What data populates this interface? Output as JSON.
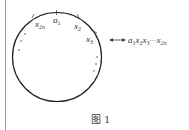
{
  "figure": {
    "caption": "图 1",
    "labels": {
      "a1": "a",
      "a1_sub": "1",
      "x2": "x",
      "x2_sub": "2",
      "x3": "x",
      "x3_sub": "3",
      "x2n": "x",
      "x2n_sub": "2n"
    },
    "sequence": {
      "a": "a",
      "a_sub": "1",
      "x2": "x",
      "x2_sub": "2",
      "x3": "x",
      "x3_sub": "3",
      "dots": "···",
      "xn": "x",
      "xn_sub": "2n"
    },
    "arrow_icon": "double-arrow"
  }
}
